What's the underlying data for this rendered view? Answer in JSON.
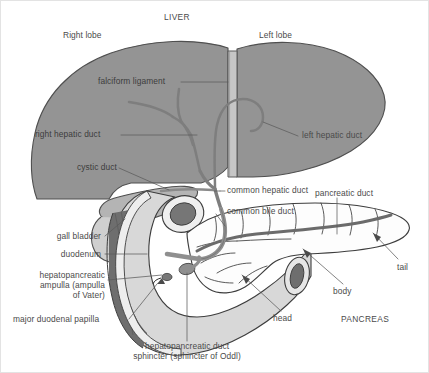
{
  "figure": {
    "background_color": "#ffffff",
    "border_color": "#e3e3e3",
    "text_color": "#4a4a4a",
    "liver_fill": "#949494",
    "liver_stroke": "#4f4f4f",
    "duct_fill": "#8f8f8f",
    "duct_stroke": "#5a5a5a",
    "pancreas_fill": "#fdfdfd",
    "pancreas_stroke": "#3d3d3d",
    "duodenum_fill": "#d8d8d8",
    "duodenum_lumen": "#6e6e6e",
    "gallbladder_fill": "#bdbdbd",
    "leader_color": "#5b5b5b"
  },
  "labels": {
    "liver_title": "LIVER",
    "right_lobe": "Right lobe",
    "left_lobe": "Left lobe",
    "falciform_ligament": "falciform ligament",
    "right_hepatic_duct": "right hepatic duct",
    "left_hepatic_duct": "left hepatic duct",
    "cystic_duct": "cystic duct",
    "common_hepatic_duct": "common hepatic duct",
    "common_bile_duct": "common bile duct",
    "pancreatic_duct": "pancreatic duct",
    "gall_bladder": "gall bladder",
    "duodenum": "duodenum",
    "hepatopancreatic_ampulla_line1": "hepatopancreatic",
    "hepatopancreatic_ampulla_line2": "ampulla (ampulla",
    "hepatopancreatic_ampulla_line3": "of Vater)",
    "major_duodenal_papilla": "major duodenal papilla",
    "sphincter_line1": "hepatopancreatic duct",
    "sphincter_line2": "sphincter (sphincter of Oddl)",
    "tail": "tail",
    "body": "body",
    "head": "head",
    "pancreas_title": "PANCREAS"
  }
}
